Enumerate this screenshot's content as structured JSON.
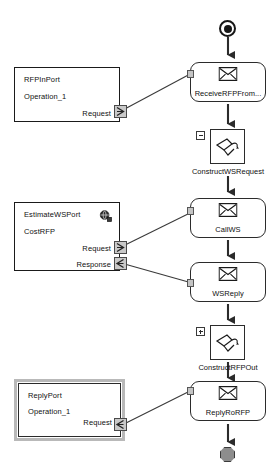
{
  "diagram": {
    "stroke_color": "#1a1a1a",
    "node_fill": "#ffffff",
    "socket_color": "#c4c4c4",
    "end_node_color": "#8d8d8d",
    "selection_color": "#b9b9b9"
  },
  "terminals": {
    "start": {
      "name": "start-event"
    },
    "end": {
      "name": "end-event"
    }
  },
  "ports": [
    {
      "id": "rfp-in-port",
      "title": "RFPInPort",
      "operation": "Operation_1",
      "roles": [
        "Request"
      ],
      "selected": false,
      "has_globe": false
    },
    {
      "id": "estimate-ws-port",
      "title": "EstimateWSPort",
      "operation": "CostRFP",
      "roles": [
        "Request",
        "Response"
      ],
      "selected": false,
      "has_globe": true
    },
    {
      "id": "reply-port",
      "title": "ReplyPort",
      "operation": "Operation_1",
      "roles": [
        "Request"
      ],
      "selected": true,
      "has_globe": false
    }
  ],
  "activities": [
    {
      "id": "receive-rfp",
      "label": "ReceiveRFPFrom...",
      "type": "message"
    },
    {
      "id": "construct-ws-request",
      "label": "ConstructWSRequest",
      "type": "assign",
      "expander": "minus"
    },
    {
      "id": "call-ws",
      "label": "CallWS",
      "type": "message"
    },
    {
      "id": "ws-reply",
      "label": "WSReply",
      "type": "message"
    },
    {
      "id": "construct-rfp-out",
      "label": "ConstructRFPOut",
      "type": "assign",
      "expander": "plus"
    },
    {
      "id": "reply-ro-rfp",
      "label": "ReplyRoRFP",
      "type": "message"
    }
  ],
  "icons": {
    "envelope": "envelope-icon",
    "assign": "assign-arrow-icon",
    "globe": "globe-icon",
    "expand_plus": "plus-box-icon",
    "expand_minus": "minus-box-icon",
    "request_chevron": "request-chevron-icon",
    "response_chevron": "response-chevron-icon"
  }
}
